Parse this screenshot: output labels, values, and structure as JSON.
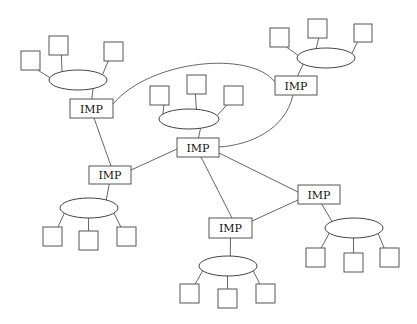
{
  "diagram": {
    "type": "network-topology",
    "background": "#ffffff",
    "imp_label": "IMP",
    "imps": [
      {
        "id": "imp-top-left",
        "label": "IMP",
        "x": 70,
        "y": 99,
        "w": 43,
        "h": 19
      },
      {
        "id": "imp-top-right",
        "label": "IMP",
        "x": 275,
        "y": 76,
        "w": 42,
        "h": 19
      },
      {
        "id": "imp-center",
        "label": "IMP",
        "x": 177,
        "y": 138,
        "w": 42,
        "h": 19
      },
      {
        "id": "imp-mid-left",
        "label": "IMP",
        "x": 89,
        "y": 166,
        "w": 42,
        "h": 18
      },
      {
        "id": "imp-right",
        "label": "IMP",
        "x": 298,
        "y": 185,
        "w": 42,
        "h": 19
      },
      {
        "id": "imp-bottom",
        "label": "IMP",
        "x": 209,
        "y": 218,
        "w": 43,
        "h": 20
      }
    ],
    "networks": [
      {
        "id": "lan-top-left",
        "cx": 78,
        "cy": 80,
        "rx": 29,
        "ry": 10,
        "imp": "imp-top-left",
        "hosts": [
          {
            "x": 21,
            "y": 51,
            "s": 19
          },
          {
            "x": 49,
            "y": 36,
            "s": 19
          },
          {
            "x": 104,
            "y": 42,
            "s": 19
          }
        ]
      },
      {
        "id": "lan-top-right",
        "cx": 326,
        "cy": 58,
        "rx": 29,
        "ry": 10,
        "imp": "imp-top-right",
        "hosts": [
          {
            "x": 270,
            "y": 28,
            "s": 19
          },
          {
            "x": 308,
            "y": 19,
            "s": 19
          },
          {
            "x": 354,
            "y": 24,
            "s": 18
          }
        ]
      },
      {
        "id": "lan-center",
        "cx": 189,
        "cy": 119,
        "rx": 30,
        "ry": 10,
        "imp": "imp-center",
        "hosts": [
          {
            "x": 150,
            "y": 86,
            "s": 19
          },
          {
            "x": 187,
            "y": 75,
            "s": 19
          },
          {
            "x": 224,
            "y": 86,
            "s": 19
          }
        ]
      },
      {
        "id": "lan-mid-left",
        "cx": 89,
        "cy": 208,
        "rx": 29,
        "ry": 10,
        "imp": "imp-mid-left",
        "hosts": [
          {
            "x": 43,
            "y": 227,
            "s": 19
          },
          {
            "x": 79,
            "y": 231,
            "s": 19
          },
          {
            "x": 117,
            "y": 227,
            "s": 19
          }
        ]
      },
      {
        "id": "lan-right",
        "cx": 354,
        "cy": 228,
        "rx": 29,
        "ry": 10,
        "imp": "imp-right",
        "hosts": [
          {
            "x": 306,
            "y": 248,
            "s": 19
          },
          {
            "x": 344,
            "y": 253,
            "s": 19
          },
          {
            "x": 380,
            "y": 248,
            "s": 19
          }
        ]
      },
      {
        "id": "lan-bottom",
        "cx": 228,
        "cy": 266,
        "rx": 29,
        "ry": 10,
        "imp": "imp-bottom",
        "hosts": [
          {
            "x": 180,
            "y": 284,
            "s": 19
          },
          {
            "x": 218,
            "y": 289,
            "s": 19
          },
          {
            "x": 256,
            "y": 284,
            "s": 19
          }
        ]
      }
    ],
    "imp_links": [
      {
        "from": "imp-top-left",
        "to": "imp-top-right",
        "path": "M113,104 C150,60 250,50 275,82"
      },
      {
        "from": "imp-top-right",
        "to": "imp-center",
        "path": "M293,95 C285,130 250,145 219,147"
      },
      {
        "from": "imp-top-left",
        "to": "imp-mid-left",
        "path": "M94,118 L111,166"
      },
      {
        "from": "imp-center",
        "to": "imp-mid-left",
        "path": "M177,149 L131,170"
      },
      {
        "from": "imp-center",
        "to": "imp-bottom",
        "path": "M201,157 L232,218"
      },
      {
        "from": "imp-center",
        "to": "imp-right",
        "path": "M219,153 L298,192"
      },
      {
        "from": "imp-right",
        "to": "imp-bottom",
        "path": "M298,200 L252,221"
      }
    ]
  }
}
